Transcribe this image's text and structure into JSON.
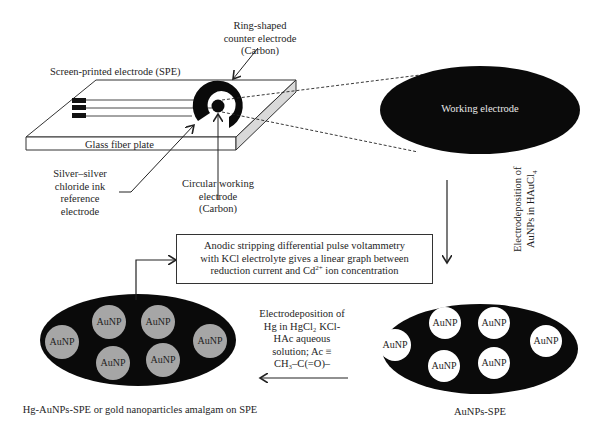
{
  "diagram": {
    "spe": {
      "label": "Screen-printed electrode (SPE)",
      "plate_label": "Glass fiber plate",
      "counter_electrode_label": [
        "Ring-shaped",
        "counter electrode",
        "(Carbon)"
      ],
      "working_electrode_label": [
        "Circular working",
        "electrode",
        "(Carbon)"
      ],
      "reference_electrode_label": [
        "Silver–silver",
        "chloride ink",
        "reference",
        "electrode"
      ]
    },
    "working_electrode_zoom": {
      "label": "Working electrode",
      "fill": "#000000"
    },
    "step1": {
      "label_line1": "Electrodeposition of",
      "label_line2_prefix": "AuNPs in HAuCl",
      "label_line2_sub": "4"
    },
    "aunps_spe": {
      "label": "AuNPs-SPE",
      "particle_label": "AuNP",
      "particle_count": 6,
      "particle_fill": "#ffffff"
    },
    "step2": {
      "lines": [
        "Electrodeposition of",
        "Hg in HgCl₂ KCl-",
        "HAc aqueous",
        "solution; Ac ≡",
        "CH₃–C(=O)–"
      ]
    },
    "hg_aunps_spe": {
      "label": "Hg-AuNPs-SPE or gold nanoparticles amalgam on SPE",
      "particle_label": "AuNP",
      "particle_count": 6,
      "particle_fill": "#a6a6a6"
    },
    "result_box": {
      "line1": "Anodic stripping differential pulse voltammetry",
      "line2": "with KCl electrolyte gives a linear graph between",
      "line3_prefix": "reduction current and Cd",
      "line3_sup": "2+",
      "line3_suffix": " ion concentration"
    },
    "colors": {
      "electrode_black": "#0a0a0a",
      "plate_side": "#d9d9d9",
      "gray_particle": "#a6a6a6",
      "line": "#333333"
    }
  }
}
